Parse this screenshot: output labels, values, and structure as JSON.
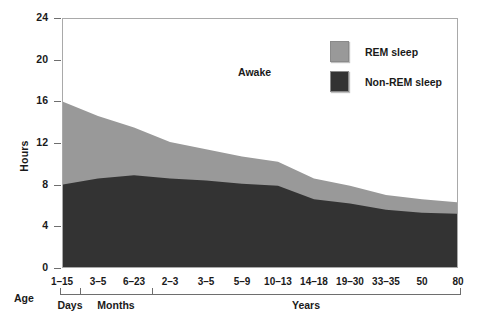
{
  "chart_data": {
    "type": "area",
    "title": "",
    "xlabel": "Age",
    "ylabel": "Hours",
    "ylim": [
      0,
      24
    ],
    "yticks": [
      0,
      4,
      8,
      12,
      16,
      20,
      24
    ],
    "grid": false,
    "stacked": true,
    "categories": [
      "1–15",
      "3–5",
      "6–23",
      "2–3",
      "3–5",
      "5–9",
      "10–13",
      "14–18",
      "19–30",
      "33–35",
      "50",
      "80"
    ],
    "x_group_brackets": [
      {
        "label": "Days",
        "categories": [
          "1–15"
        ]
      },
      {
        "label": "Months",
        "categories": [
          "3–5",
          "6–23"
        ]
      },
      {
        "label": "Years",
        "categories": [
          "2–3",
          "3–5",
          "5–9",
          "10–13",
          "14–18",
          "19–30",
          "33–35",
          "50",
          "80"
        ]
      }
    ],
    "series": [
      {
        "name": "Non-REM sleep",
        "color": "#333333",
        "values": [
          8.0,
          8.6,
          8.9,
          8.6,
          8.4,
          8.1,
          7.9,
          6.6,
          6.2,
          5.6,
          5.3,
          5.2
        ]
      },
      {
        "name": "REM sleep",
        "color": "#999999",
        "values": [
          8.0,
          6.0,
          4.6,
          3.5,
          3.0,
          2.6,
          2.3,
          2.0,
          1.7,
          1.4,
          1.3,
          1.1
        ]
      }
    ],
    "totals": [
      16.0,
      14.6,
      13.5,
      12.1,
      11.4,
      10.7,
      10.2,
      8.6,
      7.9,
      7.0,
      6.6,
      6.3
    ],
    "annotations": [
      {
        "text": "Awake",
        "region": "above-stack"
      }
    ],
    "legend": {
      "position": "top-right-inside",
      "entries": [
        {
          "label": "REM sleep",
          "color": "#999999"
        },
        {
          "label": "Non-REM sleep",
          "color": "#333333"
        }
      ]
    }
  },
  "axes": {
    "y_title": "Hours",
    "y_tick_labels": [
      "24",
      "20",
      "16",
      "12",
      "8",
      "4",
      "0"
    ],
    "x_title": "Age",
    "x_tick_labels": [
      "1–15",
      "3–5",
      "6–23",
      "2–3",
      "3–5",
      "5–9",
      "10–13",
      "14–18",
      "19–30",
      "33–35",
      "50",
      "80"
    ],
    "x_group_labels": [
      "Days",
      "Months",
      "Years"
    ]
  },
  "legend": {
    "rem_label": "REM sleep",
    "nonrem_label": "Non-REM sleep",
    "rem_color": "#999999",
    "nonrem_color": "#333333"
  },
  "annotations": {
    "awake": "Awake"
  },
  "colors": {
    "rem": "#999999",
    "nonrem": "#333333",
    "frame": "#a9a9a9",
    "text": "#1a1a1a",
    "background": "#ffffff"
  }
}
